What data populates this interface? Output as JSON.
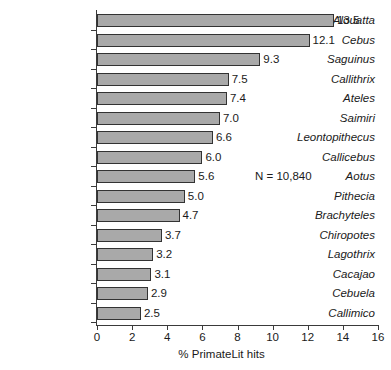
{
  "chart_data": {
    "type": "bar",
    "orientation": "horizontal",
    "title": "",
    "xlabel": "% PrimateLit hits",
    "ylabel": "",
    "xlim": [
      0,
      16
    ],
    "xticks": [
      0,
      2,
      4,
      6,
      8,
      10,
      12,
      14,
      16
    ],
    "xtick_labels": [
      "0",
      "2",
      "4",
      "6",
      "8",
      "10",
      "12",
      "14",
      "16"
    ],
    "grid": false,
    "legend": null,
    "categories": [
      "Alouatta",
      "Cebus",
      "Saguinus",
      "Callithrix",
      "Ateles",
      "Saimiri",
      "Leontopithecus",
      "Callicebus",
      "Aotus",
      "Pithecia",
      "Brachyteles",
      "Chiropotes",
      "Lagothrix",
      "Cacajao",
      "Cebuela",
      "Callimico"
    ],
    "values": [
      13.5,
      12.1,
      9.3,
      7.5,
      7.4,
      7.0,
      6.6,
      6.0,
      5.6,
      5.0,
      4.7,
      3.7,
      3.2,
      3.1,
      2.9,
      2.5
    ],
    "value_labels": [
      "13.5",
      "12.1",
      "9.3",
      "7.5",
      "7.4",
      "7.0",
      "6.6",
      "6.0",
      "5.6",
      "5.0",
      "4.7",
      "3.7",
      "3.2",
      "3.1",
      "2.9",
      "2.5"
    ],
    "annotations": [
      {
        "text": "N = 10,840",
        "x": 9.0,
        "y_category": "Aotus"
      }
    ],
    "colors": {
      "bar_fill": "#a9a9a9",
      "bar_border": "#333333",
      "axis": "#3a3a3a",
      "text": "#1a1a1a",
      "background": "#ffffff"
    }
  }
}
